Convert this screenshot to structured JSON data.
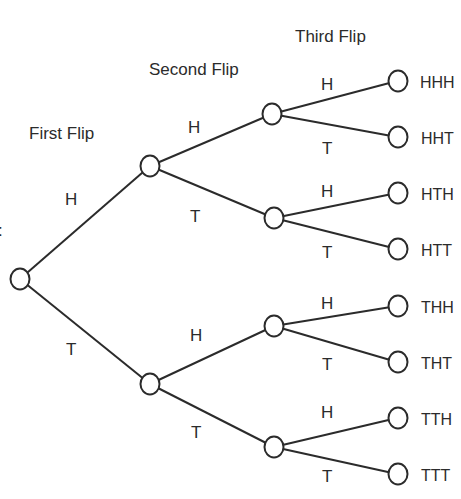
{
  "diagram": {
    "type": "probability-tree",
    "level_titles": [
      "First Flip",
      "Second Flip",
      "Third Flip"
    ],
    "left_edge_mark": ":",
    "root": {
      "id": "root"
    },
    "first_flip": [
      {
        "label": "H"
      },
      {
        "label": "T"
      }
    ],
    "second_flip": [
      {
        "label": "H"
      },
      {
        "label": "T"
      },
      {
        "label": "H"
      },
      {
        "label": "T"
      }
    ],
    "third_flip": [
      {
        "label": "H"
      },
      {
        "label": "T"
      },
      {
        "label": "H"
      },
      {
        "label": "T"
      },
      {
        "label": "H"
      },
      {
        "label": "T"
      },
      {
        "label": "H"
      },
      {
        "label": "T"
      }
    ],
    "outcomes": [
      "HHH",
      "HHT",
      "HTH",
      "HTT",
      "THH",
      "THT",
      "TTH",
      "TTT"
    ],
    "colors": {
      "line": "#2b2b2b",
      "background": "#ffffff"
    }
  }
}
